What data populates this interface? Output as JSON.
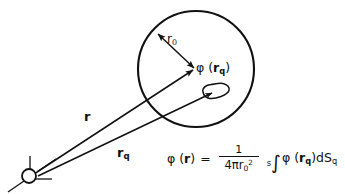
{
  "figure": {
    "background_color": "#ffffff",
    "ink_color": "#111111",
    "width": 345,
    "height": 194
  },
  "labels": {
    "radius": {
      "symbol": "r",
      "subscript": "0",
      "full": "r0"
    },
    "surface_potential": {
      "prefix": "φ (",
      "vector": "r",
      "subscript": "q",
      "suffix": ")",
      "full": "φ(rq)"
    },
    "vector_r": {
      "symbol": "r",
      "full": "r"
    },
    "vector_rq": {
      "symbol": "r",
      "subscript": "q",
      "full": "rq"
    }
  },
  "equation": {
    "lhs_prefix": "φ (",
    "lhs_vector": "r",
    "lhs_suffix": ")",
    "equals": "=",
    "fraction_numerator": "1",
    "fraction_denominator_prefix": "4π",
    "fraction_denominator_symbol": "r",
    "fraction_denominator_subscript": "0",
    "fraction_denominator_superscript": "2",
    "integral_domain": "s",
    "integral_sign": "∫",
    "integrand_prefix": "φ (",
    "integrand_vector": "r",
    "integrand_subscript": "q",
    "integrand_suffix": ")",
    "differential_prefix": "d",
    "differential_symbol": "S",
    "differential_subscript": "q",
    "plain_text": "φ(r) = 1 / (4πr0²) ∫_s φ(rq) dSq"
  },
  "geometry": {
    "sphere": {
      "center_x": 196,
      "center_y": 69,
      "radius": 58
    },
    "origin": {
      "x": 30,
      "y": 175,
      "marker_radius": 7
    },
    "radius_arrow": {
      "from_x": 157,
      "from_y": 33,
      "to_x": 195,
      "to_y": 69,
      "double_headed": true
    },
    "vector_r_arrow": {
      "from_x": 36,
      "from_y": 172,
      "to_x": 192,
      "to_y": 70
    },
    "vector_rq_arrow": {
      "from_x": 36,
      "from_y": 175,
      "to_x": 218,
      "to_y": 92
    },
    "surface_element_blob": {
      "center_x": 215,
      "center_y": 92
    }
  }
}
